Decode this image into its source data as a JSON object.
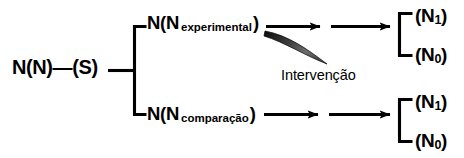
{
  "diagram": {
    "background_color": "#ffffff",
    "line_color": "#000000",
    "source": {
      "label": "N(N)—(S)"
    },
    "branches": [
      {
        "id": "experimental",
        "prefix": "N(N",
        "subscript": "experimental",
        "suffix": ")",
        "intervention": {
          "label": "Intervenção",
          "shape": "curved-wedge-arrow"
        },
        "outcomes": [
          {
            "prefix": "(N",
            "subscript": "1",
            "suffix": ")"
          },
          {
            "prefix": "(N",
            "subscript": "0",
            "suffix": ")"
          }
        ]
      },
      {
        "id": "comparacao",
        "prefix": "N(N",
        "subscript": "comparação",
        "suffix": ")",
        "intervention": null,
        "outcomes": [
          {
            "prefix": "(N",
            "subscript": "1",
            "suffix": ")"
          },
          {
            "prefix": "(N",
            "subscript": "0",
            "suffix": ")"
          }
        ]
      }
    ]
  }
}
